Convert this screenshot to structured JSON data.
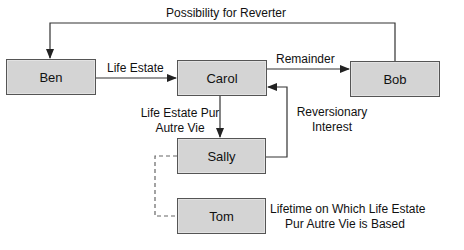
{
  "nodes": {
    "ben": {
      "label": "Ben"
    },
    "carol": {
      "label": "Carol"
    },
    "bob": {
      "label": "Bob"
    },
    "sally": {
      "label": "Sally"
    },
    "tom": {
      "label": "Tom"
    }
  },
  "edges": {
    "reverter": {
      "label": "Possibility for Reverter",
      "from": "Bob",
      "to": "Ben"
    },
    "life_estate": {
      "label": "Life Estate",
      "from": "Ben",
      "to": "Carol"
    },
    "remainder": {
      "label": "Remainder",
      "from": "Carol",
      "to": "Bob"
    },
    "pur_autre_vie": {
      "line1": "Life Estate Pur",
      "line2": "Autre Vie",
      "from": "Carol",
      "to": "Sally"
    },
    "reversionary": {
      "line1": "Reversionary",
      "line2": "Interest",
      "from": "Sally",
      "to": "Carol"
    },
    "measuring_life": {
      "line1": "Lifetime on Which Life Estate",
      "line2": "Pur Autre Vie is Based",
      "from": "Sally",
      "to": "Tom",
      "style": "dashed"
    }
  },
  "colors": {
    "box_fill": "#d4d4d4",
    "box_border": "#555555",
    "line": "#333333",
    "dashed": "#666666"
  }
}
